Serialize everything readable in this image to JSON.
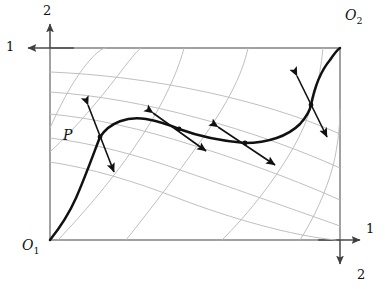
{
  "figure": {
    "type": "edgeworth-box-diagram",
    "background_color": "#ffffff",
    "box": {
      "x0": 50,
      "y0": 48,
      "x1": 340,
      "y1": 240,
      "stroke_color": "#8a8a8a",
      "stroke_width": 1.4
    },
    "origins": [
      {
        "name": "O1",
        "label": "O",
        "subscript": "1",
        "corner": "bottom-left",
        "x": 50,
        "y": 240
      },
      {
        "name": "O2",
        "label": "O",
        "subscript": "2",
        "corner": "top-right",
        "x": 340,
        "y": 48
      }
    ],
    "axes": [
      {
        "name": "axis-good-2-consumer-1",
        "label": "2",
        "direction": "up",
        "origin": "O1",
        "tip_x": 50,
        "tip_y": 22
      },
      {
        "name": "axis-good-1-consumer-2",
        "label": "1",
        "direction": "left",
        "origin": "O2",
        "tip_x": 24,
        "tip_y": 48
      },
      {
        "name": "axis-good-1-consumer-1",
        "label": "1",
        "direction": "right",
        "origin": "O1",
        "tip_x": 362,
        "tip_y": 240
      },
      {
        "name": "axis-good-2-consumer-2",
        "label": "2",
        "direction": "down",
        "origin": "O2",
        "tip_x": 340,
        "tip_y": 266
      }
    ],
    "labels": {
      "axis_2_top": "2",
      "axis_1_left": "1",
      "axis_1_right": "1",
      "axis_2_bottom": "2",
      "origin_1": "O",
      "origin_1_sub": "1",
      "origin_2": "O",
      "origin_2_sub": "2",
      "allocation_point": "P"
    },
    "indifference_curves": {
      "stroke_color": "#b9b9b9",
      "stroke_width": 0.9,
      "family_1": {
        "name": "consumer-1-indifference-curves",
        "convex_toward": "O1",
        "count": 5
      },
      "family_2": {
        "name": "consumer-2-indifference-curves",
        "convex_toward": "O2",
        "count": 5
      }
    },
    "contract_curve": {
      "name": "contract-curve",
      "stroke_color": "#111111",
      "stroke_width": 2.4,
      "from": "O1",
      "to": "O2",
      "passes_through": [
        "P"
      ]
    },
    "tangency_points": [
      {
        "name": "tangency-point-P",
        "x": 100,
        "y": 137,
        "label": "P",
        "arrow_angle_deg": -72
      },
      {
        "name": "tangency-point-2",
        "x": 179,
        "y": 129,
        "label": "",
        "arrow_angle_deg": -30
      },
      {
        "name": "tangency-point-3",
        "x": 245,
        "y": 143,
        "label": "",
        "arrow_angle_deg": -28
      },
      {
        "name": "tangency-point-4",
        "x": 311,
        "y": 105,
        "label": "",
        "arrow_angle_deg": -62
      }
    ],
    "price_line_arrows": {
      "name": "price-line-double-arrows",
      "style": "double-headed",
      "stroke_color": "#111111",
      "stroke_width": 1.6,
      "count": 4
    }
  }
}
